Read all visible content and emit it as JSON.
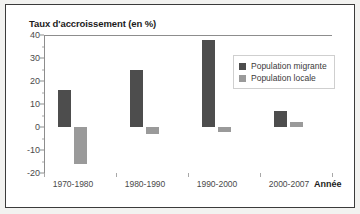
{
  "chart_data": {
    "type": "bar",
    "title": "Taux d'accroissement (en %)",
    "xlabel": "Année",
    "ylabel": "",
    "categories": [
      "1970-1980",
      "1980-1990",
      "1990-2000",
      "2000-2007"
    ],
    "series": [
      {
        "name": "Population migrante",
        "color": "#4d4d4d",
        "values": [
          16,
          25,
          38,
          7
        ]
      },
      {
        "name": "Population locale",
        "color": "#9a9a9a",
        "values": [
          -16,
          -3,
          -2,
          2
        ]
      }
    ],
    "ylim": [
      -20,
      40
    ],
    "yticks": [
      40,
      30,
      20,
      10,
      0,
      -10,
      -20
    ],
    "ytick_labels": [
      "40",
      "30",
      "20",
      "10",
      "0",
      "-10",
      "-20"
    ],
    "grid": false,
    "legend_position": "top-right",
    "legend_entries": [
      "Population migrante",
      "Population locale"
    ]
  },
  "figure": {
    "background": "#ffffff",
    "border_color": "#3b3b3b",
    "axis_color": "#8d8d8d",
    "text_color": "#1c1c1c"
  }
}
